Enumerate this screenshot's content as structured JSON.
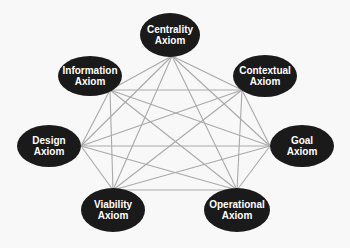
{
  "diagram": {
    "type": "complete-graph",
    "background_color": "#f8f8f8",
    "node_color": "#1a1a1a",
    "node_text_color": "#ffffff",
    "edge_color": "#a9a9a9",
    "nodes": [
      {
        "id": "centrality",
        "line1": "Centrality",
        "line2": "Axiom",
        "cx": 170,
        "cy": 35,
        "rx": 30,
        "ry": 22
      },
      {
        "id": "contextual",
        "line1": "Contextual",
        "line2": "Axiom",
        "cx": 265,
        "cy": 76,
        "rx": 32,
        "ry": 21
      },
      {
        "id": "goal",
        "line1": "Goal",
        "line2": "Axiom",
        "cx": 302,
        "cy": 146,
        "rx": 32,
        "ry": 21
      },
      {
        "id": "operational",
        "line1": "Operational",
        "line2": "Axiom",
        "cx": 237,
        "cy": 210,
        "rx": 33,
        "ry": 22
      },
      {
        "id": "viability",
        "line1": "Viability",
        "line2": "Axiom",
        "cx": 113,
        "cy": 210,
        "rx": 32,
        "ry": 22
      },
      {
        "id": "design",
        "line1": "Design",
        "line2": "Axiom",
        "cx": 49,
        "cy": 146,
        "rx": 32,
        "ry": 21
      },
      {
        "id": "information",
        "line1": "Information",
        "line2": "Axiom",
        "cx": 90,
        "cy": 76,
        "rx": 32,
        "ry": 20
      }
    ],
    "anchors": {
      "centrality": [
        172,
        56
      ],
      "contextual": [
        242,
        90
      ],
      "goal": [
        270,
        146
      ],
      "operational": [
        237,
        190
      ],
      "viability": [
        113,
        190
      ],
      "design": [
        81,
        146
      ],
      "information": [
        110,
        90
      ]
    },
    "edges": [
      [
        "centrality",
        "contextual"
      ],
      [
        "centrality",
        "goal"
      ],
      [
        "centrality",
        "operational"
      ],
      [
        "centrality",
        "viability"
      ],
      [
        "centrality",
        "design"
      ],
      [
        "centrality",
        "information"
      ],
      [
        "contextual",
        "goal"
      ],
      [
        "contextual",
        "operational"
      ],
      [
        "contextual",
        "viability"
      ],
      [
        "contextual",
        "design"
      ],
      [
        "contextual",
        "information"
      ],
      [
        "goal",
        "operational"
      ],
      [
        "goal",
        "viability"
      ],
      [
        "goal",
        "design"
      ],
      [
        "goal",
        "information"
      ],
      [
        "operational",
        "viability"
      ],
      [
        "operational",
        "design"
      ],
      [
        "operational",
        "information"
      ],
      [
        "viability",
        "design"
      ],
      [
        "viability",
        "information"
      ],
      [
        "design",
        "information"
      ]
    ]
  }
}
